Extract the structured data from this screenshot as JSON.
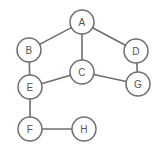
{
  "diagram": {
    "type": "node-link-graph",
    "canvas": {
      "width": 158,
      "height": 152,
      "background": "#ffffff"
    },
    "style": {
      "node_fill": "#ffffff",
      "node_stroke": "#6e6e6e",
      "node_radius": 12,
      "edge_stroke": "#6e6e6e",
      "label_color": "#555555"
    },
    "nodes": [
      {
        "id": "A",
        "label": "A",
        "x": 82,
        "y": 22
      },
      {
        "id": "B",
        "label": "B",
        "x": 29,
        "y": 50
      },
      {
        "id": "C",
        "label": "C",
        "x": 82,
        "y": 72
      },
      {
        "id": "D",
        "label": "D",
        "x": 136,
        "y": 51
      },
      {
        "id": "E",
        "label": "E",
        "x": 30,
        "y": 87
      },
      {
        "id": "F",
        "label": "F",
        "x": 30,
        "y": 129
      },
      {
        "id": "G",
        "label": "G",
        "x": 138,
        "y": 84
      },
      {
        "id": "H",
        "label": "H",
        "x": 84,
        "y": 129
      }
    ],
    "edges": [
      {
        "from": "A",
        "to": "B"
      },
      {
        "from": "A",
        "to": "C"
      },
      {
        "from": "A",
        "to": "D"
      },
      {
        "from": "B",
        "to": "E"
      },
      {
        "from": "C",
        "to": "E"
      },
      {
        "from": "C",
        "to": "G"
      },
      {
        "from": "D",
        "to": "G"
      },
      {
        "from": "E",
        "to": "F"
      },
      {
        "from": "F",
        "to": "H"
      }
    ]
  }
}
